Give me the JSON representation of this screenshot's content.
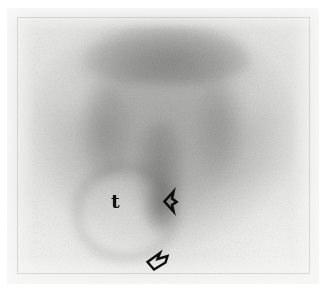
{
  "figure": {
    "modality": "scintigram",
    "view": "anterior pelvis / scrotum",
    "image_width_px": 326,
    "image_height_px": 298,
    "plate": {
      "border_color": "#e7e7e5",
      "paper_color": "#ffffff"
    },
    "field": {
      "background_color": "#e9e9e7",
      "tissue_color": "#7a7a78",
      "hot_color": "#484846",
      "cold_color": "#ffffff"
    }
  },
  "annotations": {
    "items": [
      {
        "name": "testis-label",
        "type": "text",
        "text": "t",
        "x": 111,
        "y": 192,
        "color": "#121212"
      },
      {
        "name": "lateral-arrow",
        "type": "arrow-outline",
        "text": "",
        "direction": "left",
        "x": 160,
        "y": 189,
        "color": "#0e0e0e"
      },
      {
        "name": "inferior-arrow",
        "type": "arrow-outline",
        "text": "",
        "direction": "up-left",
        "x": 145,
        "y": 250,
        "color": "#0e0e0e"
      }
    ]
  }
}
